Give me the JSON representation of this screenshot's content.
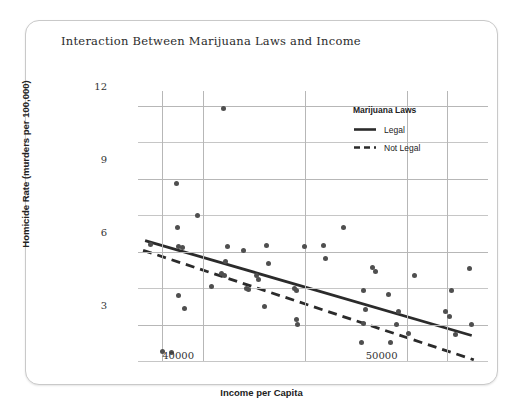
{
  "chart_data": {
    "type": "scatter",
    "title": "Interaction Between Marijuana Laws and Income",
    "xlabel": "Income per Capita",
    "ylabel": "Homicide Rate (murders per 100,000)",
    "xlim": [
      36800,
      54000
    ],
    "ylim": [
      1.5,
      12.6
    ],
    "grid": true,
    "xticks": [
      40000,
      50000
    ],
    "xtick_labels": [
      "40000",
      "50000"
    ],
    "yticks": [
      3,
      6,
      9,
      12
    ],
    "ytick_labels": [
      "3",
      "6",
      "9",
      "12"
    ],
    "y_minor_gridlines": [
      1.5,
      4.5,
      7.5,
      10.5
    ],
    "x_gridlines": [
      38000,
      40000,
      45000,
      50000,
      52000
    ],
    "legend": {
      "position": "top-right-inside",
      "title": "Marijuana Laws",
      "entries": [
        {
          "label": "Legal",
          "style": "solid"
        },
        {
          "label": "Not Legal",
          "style": "dashed"
        }
      ]
    },
    "point_color": "#4f4f4f",
    "grid_color": "#b7b7b7",
    "line_color": "#2b2b2b",
    "points": [
      {
        "x": 41000,
        "y": 11.9
      },
      {
        "x": 38700,
        "y": 8.8
      },
      {
        "x": 39700,
        "y": 7.5
      },
      {
        "x": 38750,
        "y": 7.0
      },
      {
        "x": 46900,
        "y": 7.0
      },
      {
        "x": 37400,
        "y": 6.3
      },
      {
        "x": 38800,
        "y": 6.2
      },
      {
        "x": 39000,
        "y": 6.15
      },
      {
        "x": 41200,
        "y": 6.2
      },
      {
        "x": 42000,
        "y": 6.05
      },
      {
        "x": 43100,
        "y": 6.25
      },
      {
        "x": 45000,
        "y": 6.2
      },
      {
        "x": 45900,
        "y": 6.25
      },
      {
        "x": 46000,
        "y": 5.7
      },
      {
        "x": 41100,
        "y": 5.6
      },
      {
        "x": 43200,
        "y": 5.5
      },
      {
        "x": 48300,
        "y": 5.35
      },
      {
        "x": 48450,
        "y": 5.2
      },
      {
        "x": 40900,
        "y": 5.1
      },
      {
        "x": 41050,
        "y": 5.0
      },
      {
        "x": 42600,
        "y": 5.0
      },
      {
        "x": 42700,
        "y": 4.85
      },
      {
        "x": 50400,
        "y": 5.0
      },
      {
        "x": 53100,
        "y": 5.3
      },
      {
        "x": 40400,
        "y": 4.55
      },
      {
        "x": 42150,
        "y": 4.5
      },
      {
        "x": 42250,
        "y": 4.45
      },
      {
        "x": 44500,
        "y": 4.5
      },
      {
        "x": 44600,
        "y": 4.4
      },
      {
        "x": 47900,
        "y": 4.4
      },
      {
        "x": 49100,
        "y": 4.25
      },
      {
        "x": 52200,
        "y": 4.4
      },
      {
        "x": 38800,
        "y": 4.2
      },
      {
        "x": 39100,
        "y": 3.65
      },
      {
        "x": 43000,
        "y": 3.75
      },
      {
        "x": 48000,
        "y": 3.6
      },
      {
        "x": 49600,
        "y": 3.55
      },
      {
        "x": 51900,
        "y": 3.55
      },
      {
        "x": 52100,
        "y": 3.35
      },
      {
        "x": 44600,
        "y": 3.2
      },
      {
        "x": 44650,
        "y": 3.0
      },
      {
        "x": 47900,
        "y": 3.05
      },
      {
        "x": 49500,
        "y": 3.0
      },
      {
        "x": 50100,
        "y": 2.65
      },
      {
        "x": 53200,
        "y": 3.0
      },
      {
        "x": 52400,
        "y": 2.6
      },
      {
        "x": 47800,
        "y": 2.25
      },
      {
        "x": 49200,
        "y": 2.25
      },
      {
        "x": 38000,
        "y": 1.9
      },
      {
        "x": 38450,
        "y": 1.85
      }
    ],
    "trend_lines": [
      {
        "name": "Legal",
        "style": "solid",
        "x0": 37150,
        "y0": 6.45,
        "x1": 53200,
        "y1": 2.55
      },
      {
        "name": "Not Legal",
        "style": "dashed",
        "x0": 37050,
        "y0": 6.05,
        "x1": 53300,
        "y1": 1.55
      }
    ]
  }
}
